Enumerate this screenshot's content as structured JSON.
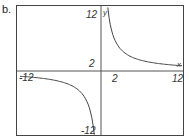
{
  "part_label": "b.",
  "chart_data": {
    "type": "line",
    "title": "",
    "function": "y = 12/x",
    "xlabel": "x",
    "ylabel": "y",
    "xlim": [
      -12,
      12
    ],
    "ylim": [
      -12,
      12
    ],
    "grid": false,
    "tick_labels": {
      "x": [
        "-12",
        "2",
        "12"
      ],
      "y": [
        "12",
        "2",
        "-12"
      ]
    },
    "series": [
      {
        "name": "right branch",
        "points": [
          [
            1,
            12
          ],
          [
            1.5,
            8
          ],
          [
            2,
            6
          ],
          [
            3,
            4
          ],
          [
            4,
            3
          ],
          [
            6,
            2
          ],
          [
            8,
            1.5
          ],
          [
            10,
            1.2
          ],
          [
            12,
            1
          ]
        ]
      },
      {
        "name": "left branch",
        "points": [
          [
            -12,
            -1
          ],
          [
            -10,
            -1.2
          ],
          [
            -8,
            -1.5
          ],
          [
            -6,
            -2
          ],
          [
            -4,
            -3
          ],
          [
            -3,
            -4
          ],
          [
            -2,
            -6
          ],
          [
            -1.5,
            -8
          ],
          [
            -1,
            -12
          ]
        ]
      }
    ],
    "colors": {
      "curve": "#444444",
      "axes": "#555555",
      "frame": "#444444"
    }
  },
  "labels": {
    "y_top": "12",
    "y_two": "2",
    "y_bottom": "-12",
    "x_left": "-12",
    "x_two": "2",
    "x_right": "12",
    "x_axis": "x",
    "y_axis": "y"
  }
}
